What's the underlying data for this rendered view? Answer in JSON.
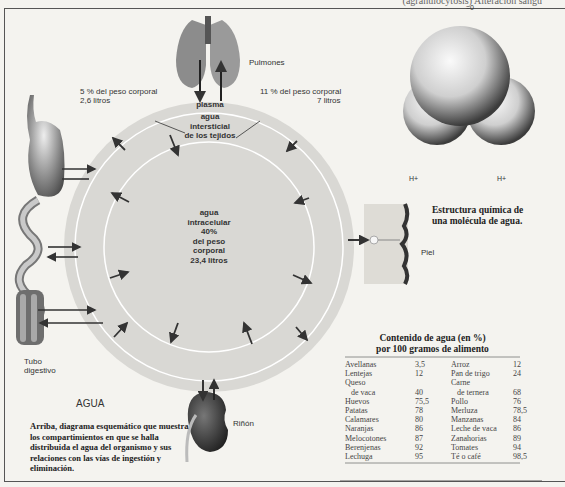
{
  "header": {
    "running_title": "(agranulocytosis) Alteración sangu"
  },
  "diagram": {
    "title": "AGUA",
    "caption": "Arriba, diagrama esquemático que muestra los compartimientos en que se halla distribuida el agua del organismo y sus relaciones con las vías de ingestión y eliminación.",
    "organs": {
      "lungs": "Pulmones",
      "digestive_tract_line1": "Tubo",
      "digestive_tract_line2": "digestivo",
      "kidney": "Riñón",
      "skin": "Piel"
    },
    "compartments": {
      "plasma": {
        "label": "plasma",
        "percent_text": "5 % del peso corporal",
        "liters_text": "2,6 litros"
      },
      "interstitial": {
        "line1": "agua",
        "line2": "intersticial",
        "line3": "de los tejidos",
        "percent_text": "11 % del peso corporal",
        "liters_text": "7 litros"
      },
      "intracellular": {
        "line1": "agua",
        "line2": "intracelular",
        "line3": "40%",
        "line4": "del peso",
        "line5": "corporal",
        "line6": "23,4 litros"
      }
    },
    "molecule": {
      "oxygen_label": "=0",
      "hydrogen_left": "H+",
      "hydrogen_right": "H+",
      "caption_line1": "Estructura química de",
      "caption_line2": "una molécula de agua."
    }
  },
  "food_table": {
    "title_line1": "Contenido de agua (en %)",
    "title_line2": "por 100 gramos de alimento",
    "rows": [
      {
        "food_a": "Avellanas",
        "value_a": "3,5",
        "food_b": "Arroz",
        "value_b": "12"
      },
      {
        "food_a": "Lentejas",
        "value_a": "12",
        "food_b": "Pan de trigo",
        "value_b": "24"
      },
      {
        "food_a": "Queso",
        "value_a": "",
        "food_b": "Carne",
        "value_b": ""
      },
      {
        "food_a": "  de vaca",
        "value_a": "40",
        "food_b": "  de ternera",
        "value_b": "68"
      },
      {
        "food_a": "Huevos",
        "value_a": "75,5",
        "food_b": "Pollo",
        "value_b": "76"
      },
      {
        "food_a": "Patatas",
        "value_a": "78",
        "food_b": "Merluza",
        "value_b": "78,5"
      },
      {
        "food_a": "Calamares",
        "value_a": "80",
        "food_b": "Manzanas",
        "value_b": "84"
      },
      {
        "food_a": "Naranjas",
        "value_a": "86",
        "food_b": "Leche de vaca",
        "value_b": "86"
      },
      {
        "food_a": "Melocotones",
        "value_a": "87",
        "food_b": "Zanahorias",
        "value_b": "89"
      },
      {
        "food_a": "Berenjenas",
        "value_a": "92",
        "food_b": "Tomates",
        "value_b": "94"
      },
      {
        "food_a": "Lechuga",
        "value_a": "95",
        "food_b": "Té o café",
        "value_b": "98,5"
      }
    ]
  },
  "colors": {
    "paper": "#f4f3ef",
    "outer_ring": "#d9d8d4",
    "inner_disk": "#dcdbd7",
    "ring_line": "#ffffff",
    "arrow": "#333333",
    "organ_dark": "#4a4a4a"
  }
}
